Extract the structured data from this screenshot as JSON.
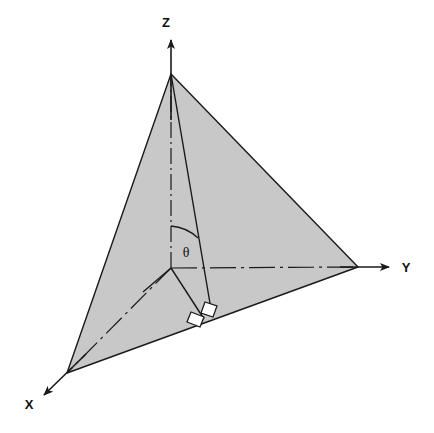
{
  "figure": {
    "background_color": "#ffffff",
    "fill_color": "#c8c8c8",
    "stroke_color": "#1a1a1a"
  },
  "axes": [
    {
      "id": "z",
      "label": "Z",
      "label_x": 167,
      "label_y": 27,
      "origin": {
        "x": 171,
        "y": 268
      },
      "tip": {
        "x": 171,
        "y": 38
      },
      "direction": "up"
    },
    {
      "id": "y",
      "label": "Y",
      "label_x": 401,
      "label_y": 271,
      "origin": {
        "x": 171,
        "y": 268
      },
      "tip": {
        "x": 391,
        "y": 267
      },
      "direction": "right"
    },
    {
      "id": "x",
      "label": "X",
      "label_x": 24,
      "label_y": 408,
      "origin": {
        "x": 171,
        "y": 268
      },
      "tip": {
        "x": 42,
        "y": 397
      },
      "direction": "lower-left"
    }
  ],
  "vertices": {
    "origin": {
      "x": 171,
      "y": 268
    },
    "z_apex": {
      "x": 171,
      "y": 74
    },
    "x_corner": {
      "x": 67,
      "y": 373
    },
    "y_corner": {
      "x": 358,
      "y": 267
    },
    "base_foot": {
      "x": 212,
      "y": 315
    },
    "origin_foot": {
      "x": 204,
      "y": 319
    }
  },
  "shaded_plane": {
    "name": "triangular-plane",
    "points": "171,74 358,267 67,373",
    "fill": "#c8c8c8",
    "stroke": "#1a1a1a",
    "stroke_width": 1.4
  },
  "angle": {
    "symbol": "θ",
    "label_x": 180,
    "label_y": 256,
    "arc_path": "M 171,226 A 42,42 0 0 1 197,237",
    "description": "polar angle between Z axis and slant line"
  },
  "right_angles": [
    {
      "name": "right-angle-marker-slant",
      "path": "M 205,302 L 217,306 L 213,317 L 201,313 Z"
    },
    {
      "name": "right-angle-marker-base",
      "path": "M 191,311 L 204,316 L 200,326 L 187,321 Z"
    }
  ],
  "lines": {
    "slant_from_apex": {
      "from": {
        "x": 171,
        "y": 74
      },
      "to": {
        "x": 212,
        "y": 315
      }
    },
    "origin_to_foot": {
      "from": {
        "x": 171,
        "y": 268
      },
      "to": {
        "x": 204,
        "y": 319
      }
    },
    "origin_to_base_left": {
      "from": {
        "x": 171,
        "y": 268
      },
      "to": {
        "x": 143,
        "y": 292
      }
    },
    "dashdot_vertical": {
      "from": {
        "x": 171,
        "y": 268
      },
      "to": {
        "x": 171,
        "y": 74
      }
    },
    "dashdot_horizontal": {
      "from": {
        "x": 171,
        "y": 268
      },
      "to": {
        "x": 358,
        "y": 267
      }
    },
    "dashdot_to_x": {
      "from": {
        "x": 171,
        "y": 268
      },
      "to": {
        "x": 67,
        "y": 373
      }
    }
  }
}
